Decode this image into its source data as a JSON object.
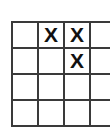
{
  "board": {
    "title": "Crossword grid fragment",
    "columns": 4,
    "rows": 4,
    "cell_size_px": 26,
    "line_color": "#3a3a3a",
    "mark_color": "#111111",
    "background_color": "#ffffff",
    "mark_glyph": "X",
    "cells": [
      [
        {
          "row": 1,
          "col": 1,
          "value": "",
          "filled": false
        },
        {
          "row": 1,
          "col": 2,
          "value": "X",
          "filled": true
        },
        {
          "row": 1,
          "col": 3,
          "value": "X",
          "filled": true
        },
        {
          "row": 1,
          "col": 4,
          "value": "",
          "filled": false
        }
      ],
      [
        {
          "row": 2,
          "col": 1,
          "value": "",
          "filled": false
        },
        {
          "row": 2,
          "col": 2,
          "value": "",
          "filled": false
        },
        {
          "row": 2,
          "col": 3,
          "value": "X",
          "filled": true
        },
        {
          "row": 2,
          "col": 4,
          "value": "",
          "filled": false
        }
      ],
      [
        {
          "row": 3,
          "col": 1,
          "value": "",
          "filled": false
        },
        {
          "row": 3,
          "col": 2,
          "value": "",
          "filled": false
        },
        {
          "row": 3,
          "col": 3,
          "value": "",
          "filled": false
        },
        {
          "row": 3,
          "col": 4,
          "value": "",
          "filled": false
        }
      ],
      [
        {
          "row": 4,
          "col": 1,
          "value": "",
          "filled": false
        },
        {
          "row": 4,
          "col": 2,
          "value": "",
          "filled": false
        },
        {
          "row": 4,
          "col": 3,
          "value": "",
          "filled": false
        },
        {
          "row": 4,
          "col": 4,
          "value": "",
          "filled": false
        }
      ]
    ]
  }
}
